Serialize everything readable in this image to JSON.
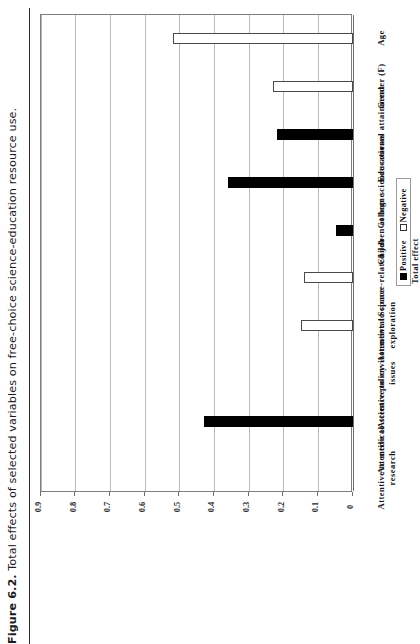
{
  "caption": {
    "label": "Figure 6.2.",
    "text": "Total effects of selected variables on free-choice science-education resource use."
  },
  "chart_data": {
    "type": "bar",
    "orientation": "vertical-rotated",
    "title": "",
    "xlabel": "",
    "ylabel": "Total effect",
    "ylim": [
      0,
      0.9
    ],
    "ytick_labels": [
      "0",
      "0.1",
      "0.2",
      "0.3",
      "0.4",
      "0.5",
      "0.6",
      "0.7",
      "0.8",
      "0.9"
    ],
    "ytick_values": [
      0,
      0.1,
      0.2,
      0.3,
      0.4,
      0.5,
      0.6,
      0.7,
      0.8,
      0.9
    ],
    "grid": true,
    "legend_position": "right",
    "legend": [
      {
        "name": "Positive",
        "swatch": "filled"
      },
      {
        "name": "Negative",
        "swatch": "open"
      }
    ],
    "categories": [
      "Age",
      "Gender (F)",
      "Educational attainment",
      "College science courses",
      "Children at home",
      "Science-related job",
      "Attentive to space exploration",
      "Attentive to environmental issues",
      "Attentive to science policy",
      "Attentive to medical research"
    ],
    "values": [
      0.52,
      0.23,
      0.22,
      0.36,
      0.05,
      0.14,
      0.15,
      0.0,
      0.43,
      0.0
    ],
    "effect_signs": [
      "Negative",
      "Negative",
      "Positive",
      "Positive",
      "Positive",
      "Negative",
      "Negative",
      "None",
      "Positive",
      "None"
    ]
  },
  "colors": {
    "positive": "#000000",
    "negative": "#ffffff",
    "negative_border": "#4a4a4a",
    "grid": "#b9b9b9",
    "frame": "#7e7e7e",
    "text": "#141414"
  }
}
